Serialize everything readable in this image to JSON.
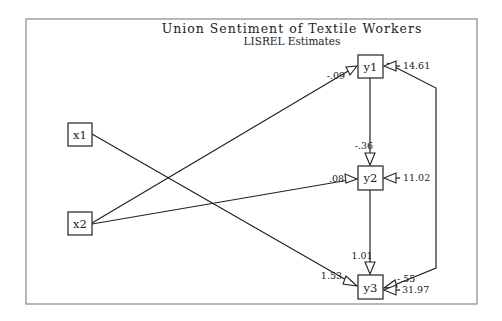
{
  "title": "Union Sentiment of Textile Workers",
  "subtitle": "LISREL Estimates",
  "colors": {
    "line": "#222222",
    "frame": "#888888",
    "background": "#ffffff"
  },
  "nodes": [
    {
      "id": "x1",
      "label": "x1"
    },
    {
      "id": "x2",
      "label": "x2"
    },
    {
      "id": "y1",
      "label": "y1"
    },
    {
      "id": "y2",
      "label": "y2"
    },
    {
      "id": "y3",
      "label": "y3"
    }
  ],
  "paths": [
    {
      "from": "x2",
      "to": "y1",
      "coef": "-.09"
    },
    {
      "from": "x2",
      "to": "y2",
      "coef": ".08"
    },
    {
      "from": "x1",
      "to": "y3",
      "coef": "1.53"
    },
    {
      "from": "y1",
      "to": "y2",
      "coef": "-.36"
    },
    {
      "from": "y2",
      "to": "y3",
      "coef": "1.01"
    },
    {
      "from": "y1",
      "to": "y3",
      "coef": "-.55"
    }
  ],
  "errors": [
    {
      "node": "y1",
      "value": "14.61"
    },
    {
      "node": "y2",
      "value": "11.02"
    },
    {
      "node": "y3",
      "value": "31.97"
    }
  ]
}
